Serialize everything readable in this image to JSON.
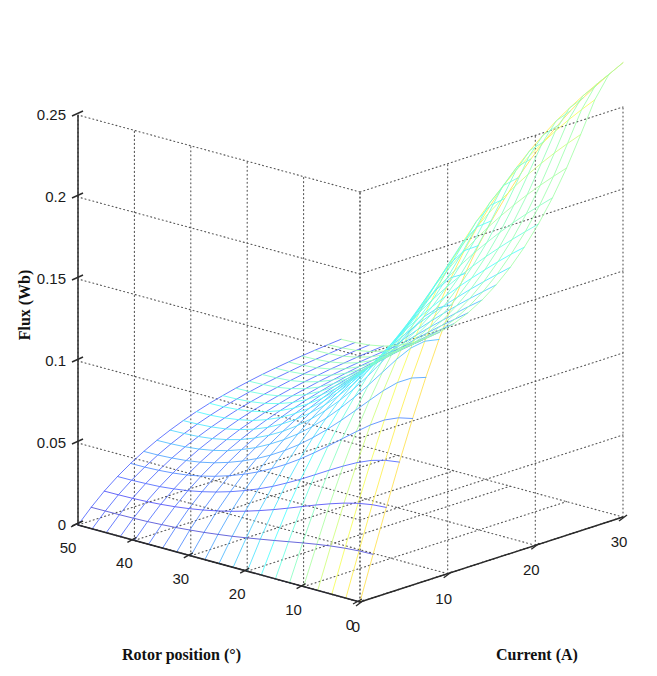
{
  "figure": {
    "background_color": "#ffffff",
    "plot_type": "3d-mesh-surface",
    "colormap": "jet"
  },
  "axes": {
    "x": {
      "title": "Rotor position (°)",
      "unit": "degrees",
      "ticks": [
        "50",
        "40",
        "30",
        "20",
        "10",
        "0"
      ],
      "tick_values": [
        50,
        40,
        30,
        20,
        10,
        0
      ],
      "range": [
        0,
        50
      ],
      "direction": "right-to-left"
    },
    "y": {
      "title": "Current (A)",
      "unit": "amperes",
      "ticks": [
        "0",
        "10",
        "20",
        "30"
      ],
      "tick_values": [
        0,
        10,
        20,
        30
      ],
      "range": [
        0,
        30
      ],
      "direction": "left-to-right"
    },
    "z": {
      "title": "Flux (Wb)",
      "unit": "weber",
      "ticks": [
        "0",
        "0.05",
        "0.1",
        "0.15",
        "0.2",
        "0.25"
      ],
      "tick_values": [
        0,
        0.05,
        0.1,
        0.15,
        0.2,
        0.25
      ],
      "range": [
        0,
        0.25
      ],
      "direction": "bottom-to-top"
    }
  },
  "chart_data": {
    "type": "surface",
    "title": "",
    "xlabel": "Rotor position (°)",
    "ylabel": "Current (A)",
    "zlabel": "Flux (Wb)",
    "xlim": [
      0,
      50
    ],
    "ylim": [
      0,
      30
    ],
    "zlim": [
      0,
      0.25
    ],
    "grid": true,
    "legend": "none",
    "colormap": "jet",
    "colorbar": false,
    "x_ticklabels": [
      "50",
      "40",
      "30",
      "20",
      "10",
      "0"
    ],
    "y_ticklabels": [
      "0",
      "10",
      "20",
      "30"
    ],
    "z_ticklabels": [
      "0",
      "0.05",
      "0.1",
      "0.15",
      "0.2",
      "0.25"
    ],
    "x": [
      0,
      2.5,
      5,
      7.5,
      10,
      12.5,
      15,
      17.5,
      20,
      22.5,
      25,
      27.5,
      30,
      32.5,
      35,
      37.5,
      40,
      42.5,
      45,
      47.5,
      50
    ],
    "y": [
      0,
      1.5,
      3,
      4.5,
      6,
      7.5,
      9,
      10.5,
      12,
      13.5,
      15,
      16.5,
      18,
      19.5,
      21,
      22.5,
      24,
      25.5,
      27,
      28.5,
      30
    ],
    "z_description": "Flux linkage surface of a switched reluctance machine. Flux rises monotonically with current and decreases as rotor position moves from aligned (0 deg) to unaligned (50 deg). Peak flux of about 0.27 Wb occurs at 30 A and 0 deg; magnetic saturation flattens the high-current aligned region.",
    "z_peak": 0.27,
    "z_min": 0.0,
    "z": [
      [
        0.0,
        0.0265,
        0.0525,
        0.0775,
        0.1015,
        0.124,
        0.1445,
        0.163,
        0.1795,
        0.194,
        0.2065,
        0.2175,
        0.2275,
        0.2365,
        0.2445,
        0.2515,
        0.258,
        0.2635,
        0.2685,
        0.273,
        0.277
      ],
      [
        0.0,
        0.0262,
        0.0518,
        0.0763,
        0.0996,
        0.1213,
        0.1411,
        0.1589,
        0.1747,
        0.1886,
        0.2006,
        0.2111,
        0.2206,
        0.2292,
        0.2368,
        0.2435,
        0.2496,
        0.2548,
        0.2595,
        0.2637,
        0.2675
      ],
      [
        0.0,
        0.0255,
        0.0503,
        0.0739,
        0.0959,
        0.1162,
        0.1346,
        0.151,
        0.1655,
        0.1783,
        0.1893,
        0.1989,
        0.2075,
        0.2152,
        0.2221,
        0.2282,
        0.2336,
        0.2383,
        0.2426,
        0.2463,
        0.2497
      ],
      [
        0.0,
        0.0245,
        0.0481,
        0.0702,
        0.0905,
        0.1089,
        0.1254,
        0.14,
        0.1528,
        0.164,
        0.1737,
        0.1821,
        0.1896,
        0.1963,
        0.2023,
        0.2076,
        0.2123,
        0.2164,
        0.2201,
        0.2233,
        0.2262
      ],
      [
        0.0,
        0.0232,
        0.0453,
        0.0657,
        0.0841,
        0.1006,
        0.1152,
        0.1281,
        0.1394,
        0.1492,
        0.1577,
        0.1651,
        0.1716,
        0.1774,
        0.1826,
        0.1872,
        0.1913,
        0.1949,
        0.1981,
        0.2009,
        0.2034
      ],
      [
        0.0,
        0.0217,
        0.0422,
        0.0608,
        0.0774,
        0.0921,
        0.105,
        0.1164,
        0.1263,
        0.135,
        0.1425,
        0.1491,
        0.1549,
        0.16,
        0.1646,
        0.1686,
        0.1722,
        0.1754,
        0.1782,
        0.1807,
        0.1829
      ],
      [
        0.0,
        0.0201,
        0.0389,
        0.0557,
        0.0706,
        0.0837,
        0.0952,
        0.1053,
        0.1141,
        0.1218,
        0.1285,
        0.1344,
        0.1396,
        0.1442,
        0.1482,
        0.1518,
        0.155,
        0.1578,
        0.1603,
        0.1625,
        0.1645
      ],
      [
        0.0,
        0.0185,
        0.0356,
        0.0507,
        0.0641,
        0.0758,
        0.0861,
        0.0951,
        0.103,
        0.1099,
        0.1159,
        0.1212,
        0.1259,
        0.13,
        0.1336,
        0.1368,
        0.1396,
        0.1421,
        0.1444,
        0.1464,
        0.1481
      ],
      [
        0.0,
        0.0169,
        0.0324,
        0.046,
        0.058,
        0.0685,
        0.0777,
        0.0858,
        0.0928,
        0.099,
        0.1044,
        0.1092,
        0.1134,
        0.1171,
        0.1203,
        0.1232,
        0.1257,
        0.128,
        0.13,
        0.1318,
        0.1334
      ],
      [
        0.0,
        0.0154,
        0.0294,
        0.0416,
        0.0524,
        0.0619,
        0.0702,
        0.0774,
        0.0838,
        0.0893,
        0.0942,
        0.0985,
        0.1023,
        0.1056,
        0.1085,
        0.1111,
        0.1134,
        0.1155,
        0.1173,
        0.1189,
        0.1204
      ],
      [
        0.0,
        0.014,
        0.0267,
        0.0377,
        0.0475,
        0.056,
        0.0635,
        0.07,
        0.0757,
        0.0808,
        0.0852,
        0.089,
        0.0924,
        0.0954,
        0.0981,
        0.1004,
        0.1025,
        0.1043,
        0.106,
        0.1075,
        0.1088
      ],
      [
        0.0,
        0.0128,
        0.0243,
        0.0343,
        0.0431,
        0.0508,
        0.0576,
        0.0635,
        0.0687,
        0.0732,
        0.0772,
        0.0807,
        0.0838,
        0.0865,
        0.0889,
        0.091,
        0.0929,
        0.0946,
        0.0961,
        0.0974,
        0.0986
      ],
      [
        0.0,
        0.0117,
        0.0222,
        0.0313,
        0.0393,
        0.0463,
        0.0525,
        0.0578,
        0.0625,
        0.0666,
        0.0702,
        0.0734,
        0.0762,
        0.0787,
        0.0808,
        0.0828,
        0.0845,
        0.086,
        0.0874,
        0.0886,
        0.0897
      ],
      [
        0.0,
        0.0108,
        0.0204,
        0.0288,
        0.0361,
        0.0425,
        0.0481,
        0.053,
        0.0573,
        0.0611,
        0.0644,
        0.0673,
        0.0699,
        0.0721,
        0.0741,
        0.0759,
        0.0775,
        0.0789,
        0.0801,
        0.0812,
        0.0822
      ],
      [
        0.0,
        0.01,
        0.0189,
        0.0266,
        0.0334,
        0.0393,
        0.0445,
        0.049,
        0.0529,
        0.0564,
        0.0595,
        0.0622,
        0.0645,
        0.0666,
        0.0685,
        0.0701,
        0.0716,
        0.0728,
        0.074,
        0.075,
        0.0759
      ],
      [
        0.0,
        0.0094,
        0.0177,
        0.0249,
        0.0312,
        0.0367,
        0.0415,
        0.0457,
        0.0494,
        0.0527,
        0.0555,
        0.058,
        0.0602,
        0.0622,
        0.0639,
        0.0654,
        0.0668,
        0.068,
        0.069,
        0.07,
        0.0708
      ],
      [
        0.0,
        0.0089,
        0.0168,
        0.0236,
        0.0295,
        0.0347,
        0.0393,
        0.0433,
        0.0468,
        0.0498,
        0.0525,
        0.0549,
        0.057,
        0.0588,
        0.0605,
        0.0619,
        0.0632,
        0.0643,
        0.0653,
        0.0662,
        0.067
      ],
      [
        0.0,
        0.0086,
        0.0162,
        0.0227,
        0.0284,
        0.0334,
        0.0378,
        0.0416,
        0.0449,
        0.0479,
        0.0505,
        0.0527,
        0.0547,
        0.0565,
        0.0581,
        0.0594,
        0.0607,
        0.0617,
        0.0627,
        0.0636,
        0.0643
      ],
      [
        0.0,
        0.0084,
        0.0158,
        0.0222,
        0.0277,
        0.0326,
        0.0368,
        0.0405,
        0.0438,
        0.0467,
        0.0492,
        0.0514,
        0.0533,
        0.055,
        0.0565,
        0.0579,
        0.0591,
        0.0601,
        0.061,
        0.0619,
        0.0626
      ],
      [
        0.0,
        0.0083,
        0.0156,
        0.0219,
        0.0273,
        0.0321,
        0.0363,
        0.04,
        0.0432,
        0.046,
        0.0485,
        0.0507,
        0.0526,
        0.0543,
        0.0558,
        0.0571,
        0.0583,
        0.0593,
        0.0602,
        0.0611,
        0.0618
      ],
      [
        0.0,
        0.0082,
        0.0155,
        0.0218,
        0.0272,
        0.0319,
        0.0361,
        0.0397,
        0.0429,
        0.0458,
        0.0483,
        0.0504,
        0.0523,
        0.054,
        0.0555,
        0.0568,
        0.0579,
        0.059,
        0.0599,
        0.0607,
        0.0614
      ]
    ]
  }
}
